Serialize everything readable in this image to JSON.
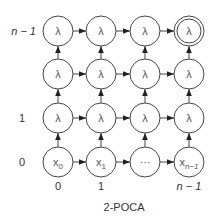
{
  "diagram": {
    "caption": "2-POCA",
    "row_labels": [
      {
        "row": 0,
        "text": "0",
        "italic": false
      },
      {
        "row": 1,
        "text": "1",
        "italic": false
      },
      {
        "row": 2,
        "text": "",
        "italic": false
      },
      {
        "row": 3,
        "text": "n − 1",
        "italic": true
      }
    ],
    "col_labels": [
      {
        "col": 0,
        "text": "0",
        "italic": false
      },
      {
        "col": 1,
        "text": "1",
        "italic": false
      },
      {
        "col": 2,
        "text": "",
        "italic": false
      },
      {
        "col": 3,
        "text": "n − 1",
        "italic": true
      }
    ],
    "grid": [
      [
        {
          "label": "x",
          "sub": "0"
        },
        {
          "label": "x",
          "sub": "1"
        },
        {
          "label": "···",
          "sub": ""
        },
        {
          "label": "x",
          "sub": "n−1"
        }
      ],
      [
        {
          "label": "λ",
          "sub": ""
        },
        {
          "label": "λ",
          "sub": ""
        },
        {
          "label": "λ",
          "sub": ""
        },
        {
          "label": "λ",
          "sub": ""
        }
      ],
      [
        {
          "label": "λ",
          "sub": ""
        },
        {
          "label": "λ",
          "sub": ""
        },
        {
          "label": "λ",
          "sub": ""
        },
        {
          "label": "λ",
          "sub": ""
        }
      ],
      [
        {
          "label": "λ",
          "sub": ""
        },
        {
          "label": "λ",
          "sub": ""
        },
        {
          "label": "λ",
          "sub": ""
        },
        {
          "label": "λ",
          "sub": "",
          "accepting": true
        }
      ]
    ],
    "edges": "right-and-up between adjacent nodes"
  }
}
